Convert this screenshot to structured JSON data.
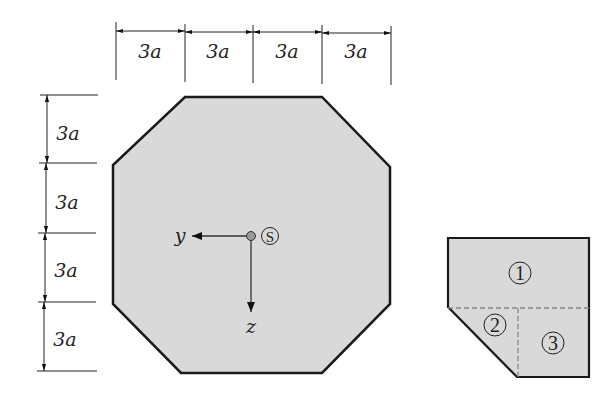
{
  "figure": {
    "type": "cross-section diagram",
    "main_section": {
      "shape": "octagon",
      "fill": "#d9d9d9",
      "stroke": "#1a1a1a"
    },
    "top_dimensions": [
      "3a",
      "3a",
      "3a",
      "3a"
    ],
    "left_dimensions": [
      "3a",
      "3a",
      "3a",
      "3a"
    ],
    "axes": {
      "y_label": "y",
      "z_label": "z",
      "centroid_label": "S"
    },
    "sub_section": {
      "shape": "corner decomposition",
      "parts": [
        "1",
        "2",
        "3"
      ],
      "part_glyphs": [
        "①",
        "②",
        "③"
      ]
    }
  }
}
